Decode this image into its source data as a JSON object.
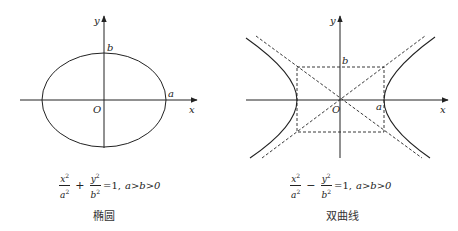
{
  "panels": [
    {
      "id": "ellipse",
      "caption": "椭圆",
      "formula": {
        "term1_num": "x",
        "term1_den": "a",
        "exp": "2",
        "operator": "+",
        "term2_num": "y",
        "term2_den": "b",
        "rhs": "=1,",
        "condition": "a>b>0"
      },
      "labels": {
        "x_axis": "x",
        "y_axis": "y",
        "origin": "O",
        "a": "a",
        "b": "b"
      }
    },
    {
      "id": "hyperbola",
      "caption": "双曲线",
      "formula": {
        "term1_num": "x",
        "term1_den": "a",
        "exp": "2",
        "operator": "−",
        "term2_num": "y",
        "term2_den": "b",
        "rhs": "=1,",
        "condition": "a>b>0"
      },
      "labels": {
        "x_axis": "x",
        "y_axis": "y",
        "origin": "O",
        "a": "a",
        "b": "b"
      }
    }
  ],
  "colors": {
    "stroke": "#222222",
    "background": "#ffffff"
  }
}
